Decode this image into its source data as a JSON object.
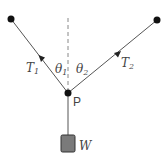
{
  "diagram": {
    "title": "",
    "colors": {
      "line": "#555555",
      "dot": "#111111",
      "weight_fill": "#7a7a7a",
      "weight_stroke": "#333333",
      "text": "#444444",
      "dashed": "#888888"
    },
    "nodes": {
      "left_anchor": {
        "x": 11,
        "y": 19
      },
      "right_anchor": {
        "x": 157,
        "y": 20
      },
      "point_p": {
        "x": 68,
        "y": 93,
        "label": "P"
      },
      "weight": {
        "x": 61,
        "y": 135,
        "w": 14,
        "h": 17,
        "label": "W"
      }
    },
    "labels": {
      "t1_main": "T",
      "t1_sub": "1",
      "t2_main": "T",
      "t2_sub": "2",
      "theta1_main": "θ",
      "theta1_sub": "1",
      "theta2_main": "θ",
      "theta2_sub": "2",
      "p": "P",
      "w": "W"
    }
  }
}
